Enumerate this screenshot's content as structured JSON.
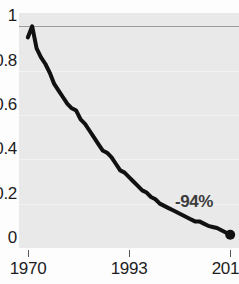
{
  "chart_data": {
    "type": "line",
    "title": "",
    "subtitle": "",
    "xlabel": "",
    "ylabel": "",
    "xlim": [
      1968,
      2018
    ],
    "ylim": [
      0,
      1.06
    ],
    "grid": true,
    "legend": false,
    "legend_position": "none",
    "x_ticks": [
      {
        "value": 1970,
        "label": "1970"
      },
      {
        "value": 1993,
        "label": "1993"
      },
      {
        "value": 2016,
        "label": "2016"
      }
    ],
    "y_ticks": [
      {
        "value": 1,
        "label": "1"
      },
      {
        "value": 0.8,
        "label": "0.8"
      },
      {
        "value": 0.6,
        "label": "0.6"
      },
      {
        "value": 0.4,
        "label": "0.4"
      },
      {
        "value": 0.2,
        "label": "0.2"
      },
      {
        "value": 0,
        "label": "0"
      }
    ],
    "series": [
      {
        "name": "index",
        "color": "#111111",
        "line_width": 4,
        "end_marker": true,
        "x": [
          1970,
          1971,
          1972,
          1973,
          1974,
          1975,
          1976,
          1977,
          1978,
          1979,
          1980,
          1981,
          1982,
          1983,
          1984,
          1985,
          1986,
          1987,
          1988,
          1989,
          1990,
          1991,
          1992,
          1993,
          1994,
          1995,
          1996,
          1997,
          1998,
          1999,
          2000,
          2001,
          2002,
          2003,
          2004,
          2005,
          2006,
          2007,
          2008,
          2009,
          2010,
          2011,
          2012,
          2013,
          2014,
          2015,
          2016
        ],
        "values": [
          0.95,
          1.0,
          0.9,
          0.86,
          0.83,
          0.79,
          0.74,
          0.71,
          0.68,
          0.65,
          0.63,
          0.62,
          0.58,
          0.56,
          0.53,
          0.5,
          0.47,
          0.44,
          0.43,
          0.41,
          0.38,
          0.35,
          0.34,
          0.32,
          0.3,
          0.28,
          0.26,
          0.25,
          0.23,
          0.22,
          0.2,
          0.19,
          0.18,
          0.17,
          0.16,
          0.15,
          0.14,
          0.13,
          0.12,
          0.12,
          0.11,
          0.1,
          0.095,
          0.09,
          0.08,
          0.07,
          0.06
        ]
      }
    ],
    "annotations": [
      {
        "text": "-94%",
        "x_px": 175,
        "y_px": 193,
        "color": "#3c3c3c"
      }
    ],
    "colors": {
      "plot_background": "#e9e9e9",
      "page_background": "#fdfdfd",
      "gridline": "#f3f3f3",
      "gridline_major": "#9b9b9b",
      "tick_label": "#1d1d1d",
      "line": "#111111"
    }
  }
}
